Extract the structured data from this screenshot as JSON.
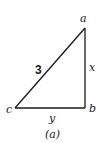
{
  "diagram": {
    "type": "right-triangle",
    "caption": "(a)",
    "vertices": {
      "a": {
        "label": "a",
        "x": 85,
        "y": 28
      },
      "b": {
        "label": "b",
        "x": 85,
        "y": 108
      },
      "c": {
        "label": "c",
        "x": 15,
        "y": 108
      }
    },
    "sides": {
      "hypotenuse": {
        "from": "c",
        "to": "a",
        "label": "3"
      },
      "vertical": {
        "from": "a",
        "to": "b",
        "label": "x"
      },
      "horizontal": {
        "from": "c",
        "to": "b",
        "label": "y"
      }
    },
    "stroke_color": "#1a1a1a"
  }
}
